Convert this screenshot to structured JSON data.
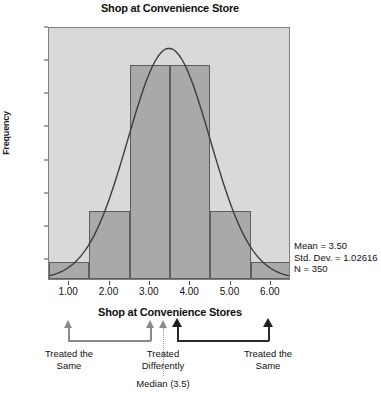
{
  "chart_data": {
    "type": "bar",
    "title": "Shop at Convenience Store",
    "xlabel": "Shop at Convenience Stores",
    "ylabel": "Frequency",
    "categories": [
      "1.00",
      "2.00",
      "3.00",
      "4.00",
      "5.00",
      "6.00"
    ],
    "values": [
      10,
      40,
      125,
      125,
      40,
      10
    ],
    "xlim": [
      0.5,
      6.5
    ],
    "ylim": [
      0,
      148
    ],
    "yticks": [
      0,
      20,
      40,
      60,
      80,
      100,
      120,
      140
    ],
    "xticks": [
      "1.00",
      "2.00",
      "3.00",
      "4.00",
      "5.00",
      "6.00"
    ],
    "grid": false,
    "legend": "none",
    "overlay": {
      "type": "normal-curve",
      "mean": 3.5,
      "std_dev": 1.02616,
      "peak_value": 136
    },
    "annotations": {
      "stats": [
        "Mean = 3.50",
        "Std. Dev. = 1.02616",
        "N = 350"
      ],
      "median_label": "Median (3.5)",
      "brackets": [
        {
          "label_line1": "Treated the",
          "label_line2": "Same",
          "tone": "light"
        },
        {
          "label_line1": "Treated",
          "label_line2": "Differently",
          "tone": "light"
        },
        {
          "label_line1": "Treated the",
          "label_line2": "Same",
          "tone": "dark"
        }
      ]
    }
  },
  "chart": {
    "title": "Shop at Convenience Store",
    "y_axis_title": "Frequency",
    "x_axis_title": "Shop at Convenience Stores",
    "y_ticks": [
      "140",
      "120",
      "100",
      "80",
      "60",
      "40",
      "20",
      "0"
    ],
    "x_ticks": [
      "1.00",
      "2.00",
      "3.00",
      "4.00",
      "5.00",
      "6.00"
    ],
    "bars": [
      {
        "category": "1.00",
        "frequency": 10
      },
      {
        "category": "2.00",
        "frequency": 40
      },
      {
        "category": "3.00",
        "frequency": 125
      },
      {
        "category": "4.00",
        "frequency": 125
      },
      {
        "category": "5.00",
        "frequency": 40
      },
      {
        "category": "6.00",
        "frequency": 10
      }
    ],
    "stats": {
      "mean": "Mean = 3.50",
      "std_dev": "Std. Dev. = 1.02616",
      "n": "N = 350"
    },
    "colors": {
      "bar_fill": "#a9a9a9",
      "bar_stroke": "#5d5d5d",
      "plot_background": "#d9d9d9",
      "curve": "#3c3c3c",
      "annotation_dark": "#1f1f1f",
      "annotation_light": "#8a8a8a"
    }
  },
  "annotation": {
    "left_label_line1": "Treated the",
    "left_label_line2": "Same",
    "middle_label_line1": "Treated",
    "middle_label_line2": "Differently",
    "right_label_line1": "Treated the",
    "right_label_line2": "Same",
    "median_label": "Median (3.5)"
  }
}
